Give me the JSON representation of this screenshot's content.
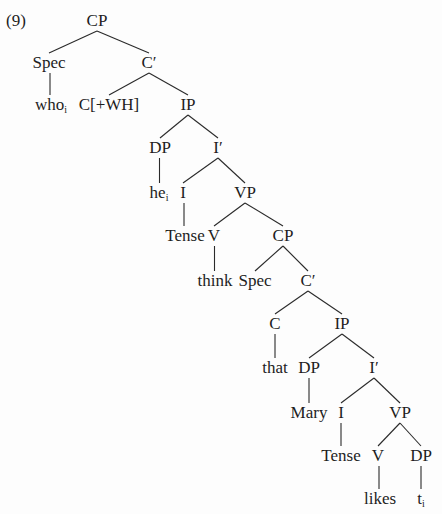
{
  "example_number": "(9)",
  "chart_data": {
    "type": "tree",
    "title": "(9)",
    "nodes": [
      {
        "id": "n0",
        "label": "CP",
        "sub": "",
        "x": 97,
        "y": 21
      },
      {
        "id": "n1",
        "label": "Spec",
        "sub": "",
        "x": 49,
        "y": 63
      },
      {
        "id": "n2",
        "label": "C′",
        "sub": "",
        "x": 149,
        "y": 63
      },
      {
        "id": "n3",
        "label": "who",
        "sub": "i",
        "x": 51,
        "y": 105
      },
      {
        "id": "n4",
        "label": "C[+WH]",
        "sub": "",
        "x": 109,
        "y": 105
      },
      {
        "id": "n5",
        "label": "IP",
        "sub": "",
        "x": 188,
        "y": 105
      },
      {
        "id": "n6",
        "label": "DP",
        "sub": "",
        "x": 160,
        "y": 148
      },
      {
        "id": "n7",
        "label": "I′",
        "sub": "",
        "x": 218,
        "y": 148
      },
      {
        "id": "n8",
        "label": "he",
        "sub": "i",
        "x": 159,
        "y": 193
      },
      {
        "id": "n9",
        "label": "I",
        "sub": "",
        "x": 183,
        "y": 193
      },
      {
        "id": "n10",
        "label": "VP",
        "sub": "",
        "x": 245,
        "y": 193
      },
      {
        "id": "n11",
        "label": "Tense",
        "sub": "",
        "x": 185,
        "y": 236
      },
      {
        "id": "n12",
        "label": "V",
        "sub": "",
        "x": 214,
        "y": 236
      },
      {
        "id": "n13",
        "label": "CP",
        "sub": "",
        "x": 283,
        "y": 236
      },
      {
        "id": "n14",
        "label": "think",
        "sub": "",
        "x": 215,
        "y": 281
      },
      {
        "id": "n15",
        "label": "Spec",
        "sub": "",
        "x": 255,
        "y": 281
      },
      {
        "id": "n16",
        "label": "C′",
        "sub": "",
        "x": 308,
        "y": 281
      },
      {
        "id": "n17",
        "label": "C",
        "sub": "",
        "x": 275,
        "y": 324
      },
      {
        "id": "n18",
        "label": "IP",
        "sub": "",
        "x": 342,
        "y": 324
      },
      {
        "id": "n19",
        "label": "that",
        "sub": "",
        "x": 275,
        "y": 368
      },
      {
        "id": "n20",
        "label": "DP",
        "sub": "",
        "x": 309,
        "y": 368
      },
      {
        "id": "n21",
        "label": "I′",
        "sub": "",
        "x": 374,
        "y": 368
      },
      {
        "id": "n22",
        "label": "Mary",
        "sub": "",
        "x": 309,
        "y": 413
      },
      {
        "id": "n23",
        "label": "I",
        "sub": "",
        "x": 341,
        "y": 413
      },
      {
        "id": "n24",
        "label": "VP",
        "sub": "",
        "x": 400,
        "y": 413
      },
      {
        "id": "n25",
        "label": "Tense",
        "sub": "",
        "x": 341,
        "y": 456
      },
      {
        "id": "n26",
        "label": "V",
        "sub": "",
        "x": 378,
        "y": 456
      },
      {
        "id": "n27",
        "label": "DP",
        "sub": "",
        "x": 421,
        "y": 456
      },
      {
        "id": "n28",
        "label": "likes",
        "sub": "",
        "x": 380,
        "y": 499
      },
      {
        "id": "n29",
        "label": "t",
        "sub": "i",
        "x": 421,
        "y": 499
      }
    ],
    "edges": [
      [
        "n0",
        "n1"
      ],
      [
        "n0",
        "n2"
      ],
      [
        "n1",
        "n3"
      ],
      [
        "n2",
        "n4"
      ],
      [
        "n2",
        "n5"
      ],
      [
        "n5",
        "n6"
      ],
      [
        "n5",
        "n7"
      ],
      [
        "n6",
        "n8"
      ],
      [
        "n7",
        "n9"
      ],
      [
        "n7",
        "n10"
      ],
      [
        "n9",
        "n11"
      ],
      [
        "n10",
        "n12"
      ],
      [
        "n10",
        "n13"
      ],
      [
        "n12",
        "n14"
      ],
      [
        "n13",
        "n15"
      ],
      [
        "n13",
        "n16"
      ],
      [
        "n16",
        "n17"
      ],
      [
        "n16",
        "n18"
      ],
      [
        "n17",
        "n19"
      ],
      [
        "n18",
        "n20"
      ],
      [
        "n18",
        "n21"
      ],
      [
        "n20",
        "n22"
      ],
      [
        "n21",
        "n23"
      ],
      [
        "n21",
        "n24"
      ],
      [
        "n23",
        "n25"
      ],
      [
        "n24",
        "n26"
      ],
      [
        "n24",
        "n27"
      ],
      [
        "n26",
        "n28"
      ],
      [
        "n27",
        "n29"
      ]
    ]
  }
}
